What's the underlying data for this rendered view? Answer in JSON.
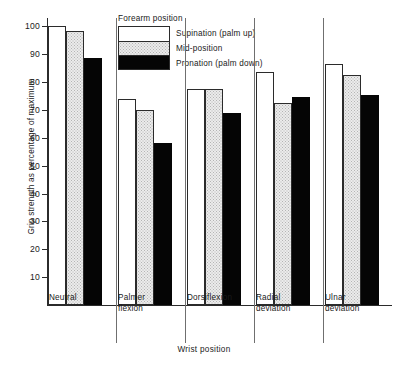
{
  "chart_data": {
    "type": "bar",
    "title": "",
    "xlabel": "Wrist position",
    "ylabel": "Grip strength as percentage of maximum",
    "categories": [
      "Neutral",
      "Palmer\nflexion",
      "Dorsiflexion",
      "Radial\ndeviation",
      "Ulnar\ndeviation"
    ],
    "series": [
      {
        "name": "Supination (palm up)",
        "values": [
          100.0,
          74.0,
          77.5,
          83.5,
          86.5
        ],
        "fill": "white",
        "color": "#ffffff"
      },
      {
        "name": "Mid-position",
        "values": [
          98.5,
          70.0,
          77.5,
          72.5,
          82.5
        ],
        "fill": "stipple",
        "color": "#ebebeb"
      },
      {
        "name": "Pronation (palm down)",
        "values": [
          88.5,
          58.0,
          69.0,
          74.5,
          75.5
        ],
        "fill": "black",
        "color": "#050505"
      }
    ],
    "ylim": [
      0,
      103
    ],
    "yticks": [
      10,
      20,
      30,
      40,
      50,
      60,
      70,
      80,
      90,
      100
    ],
    "grid": false,
    "legend_position": "top-center",
    "legend_title": "Forearm position"
  },
  "legend": {
    "title": "Forearm position",
    "items": [
      {
        "label": "Supination (palm up)"
      },
      {
        "label": "Mid-position"
      },
      {
        "label": "Pronation (palm down)"
      }
    ]
  },
  "axes": {
    "y_title": "Grip strength as percentage of maximum",
    "x_title": "Wrist position",
    "y_tick_labels": [
      "10",
      "20",
      "30",
      "40",
      "50",
      "60",
      "70",
      "80",
      "90",
      "100"
    ],
    "x_tick_labels": [
      "Neutral",
      "Palmer\nflexion",
      "Dorsiflexion",
      "Radial\ndeviation",
      "Ulnar\ndeviation"
    ]
  }
}
